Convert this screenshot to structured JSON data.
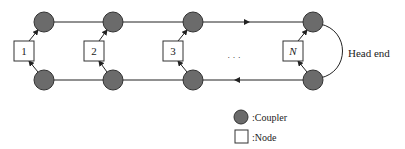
{
  "diagram": {
    "type": "ring-topology",
    "nodes": [
      {
        "label": "1",
        "x": 24
      },
      {
        "label": "2",
        "x": 94
      },
      {
        "label": "3",
        "x": 173
      },
      {
        "label": "N",
        "x": 293,
        "italic": true
      }
    ],
    "ellipsis": "· · ·",
    "head_end_label": "Head end",
    "legend": [
      {
        "symbol": "circle",
        "label": ":Coupler"
      },
      {
        "symbol": "square",
        "label": ":Node"
      }
    ],
    "colors": {
      "coupler_fill": "#6b6b6b",
      "coupler_stroke": "#333333",
      "line": "#222222",
      "node_fill": "#ffffff"
    }
  }
}
